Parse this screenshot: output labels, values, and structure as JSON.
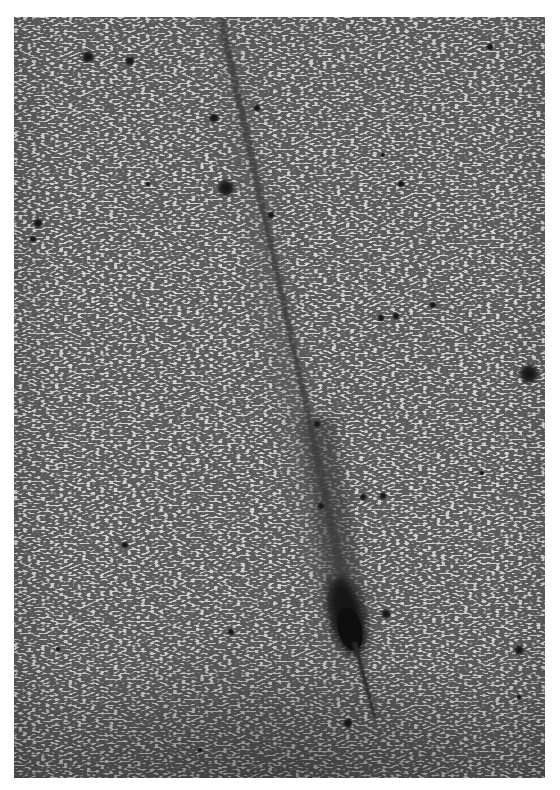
{
  "image": {
    "subject": "comet with long ion tail over star field",
    "rendering": "photographic negative, grayscale",
    "colors": {
      "border": "#ffffff",
      "sky": "#d8d8d8",
      "sky_dark_bottom": "#b8b8b8",
      "tail": "#3a3a3a",
      "coma": "#1a1a1a",
      "star": "#1e1e1e"
    },
    "plate": {
      "x": 14,
      "y": 17,
      "width": 531,
      "height": 761
    },
    "comet": {
      "head": {
        "x": 335,
        "y": 610,
        "rx": 17,
        "ry": 38
      },
      "tail_start": {
        "x": 205,
        "y": 0
      },
      "tail_end": {
        "x": 340,
        "y": 620
      },
      "anti_tail_end": {
        "x": 360,
        "y": 700
      }
    },
    "bright_stars": [
      {
        "x": 74,
        "y": 40,
        "r": 5
      },
      {
        "x": 116,
        "y": 44,
        "r": 4
      },
      {
        "x": 212,
        "y": 171,
        "r": 7
      },
      {
        "x": 24,
        "y": 206,
        "r": 4
      },
      {
        "x": 19,
        "y": 222,
        "r": 3
      },
      {
        "x": 515,
        "y": 357,
        "r": 8
      },
      {
        "x": 476,
        "y": 30,
        "r": 3
      },
      {
        "x": 243,
        "y": 91,
        "r": 3
      },
      {
        "x": 200,
        "y": 101,
        "r": 4
      },
      {
        "x": 303,
        "y": 407,
        "r": 3
      },
      {
        "x": 349,
        "y": 480,
        "r": 3
      },
      {
        "x": 369,
        "y": 479,
        "r": 3
      },
      {
        "x": 372,
        "y": 597,
        "r": 4
      },
      {
        "x": 505,
        "y": 633,
        "r": 4
      },
      {
        "x": 217,
        "y": 615,
        "r": 3
      },
      {
        "x": 334,
        "y": 706,
        "r": 4
      },
      {
        "x": 111,
        "y": 528,
        "r": 3
      },
      {
        "x": 367,
        "y": 301,
        "r": 3
      },
      {
        "x": 382,
        "y": 299,
        "r": 3
      },
      {
        "x": 419,
        "y": 288,
        "r": 3
      },
      {
        "x": 257,
        "y": 198,
        "r": 3
      },
      {
        "x": 387,
        "y": 167,
        "r": 3
      },
      {
        "x": 369,
        "y": 138,
        "r": 2
      },
      {
        "x": 134,
        "y": 167,
        "r": 2
      },
      {
        "x": 307,
        "y": 489,
        "r": 3
      },
      {
        "x": 468,
        "y": 456,
        "r": 2
      },
      {
        "x": 44,
        "y": 632,
        "r": 2
      },
      {
        "x": 186,
        "y": 733,
        "r": 2
      },
      {
        "x": 505,
        "y": 680,
        "r": 2
      }
    ]
  }
}
